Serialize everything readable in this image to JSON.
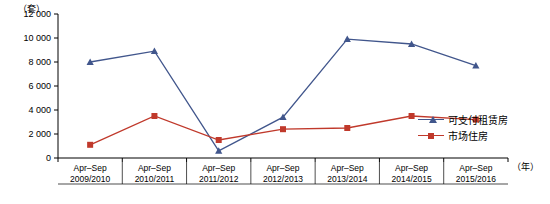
{
  "chart_data": {
    "type": "line",
    "title": "",
    "xlabel": "（年）",
    "ylabel": "（套）",
    "ylim": [
      0,
      12000
    ],
    "yticks": [
      "0",
      "2 000",
      "4 000",
      "6 000",
      "8 000",
      "10 000",
      "12 000"
    ],
    "ytick_values": [
      0,
      2000,
      4000,
      6000,
      8000,
      10000,
      12000
    ],
    "grid": false,
    "legend_position": "right",
    "categories": [
      "Apr–Sep\n2009/2010",
      "Apr–Sep\n2010/2011",
      "Apr–Sep\n2011/2012",
      "Apr–Sep\n2012/2013",
      "Apr–Sep\n2013/2014",
      "Apr–Sep\n2014/2015",
      "Apr–Sep\n2015/2016"
    ],
    "categories_top": [
      "Apr–Sep",
      "Apr–Sep",
      "Apr–Sep",
      "Apr–Sep",
      "Apr–Sep",
      "Apr–Sep",
      "Apr–Sep"
    ],
    "categories_bottom": [
      "2009/2010",
      "2010/2011",
      "2011/2012",
      "2012/2013",
      "2013/2014",
      "2014/2015",
      "2015/2016"
    ],
    "series": [
      {
        "name": "可支付租赁房",
        "color": "#41568c",
        "marker": "triangle",
        "values": [
          8000,
          8900,
          600,
          3400,
          9900,
          9500,
          7700
        ]
      },
      {
        "name": "市场住房",
        "color": "#c0392b",
        "marker": "square",
        "values": [
          1100,
          3500,
          1500,
          2400,
          2500,
          3500,
          3200
        ]
      }
    ]
  }
}
